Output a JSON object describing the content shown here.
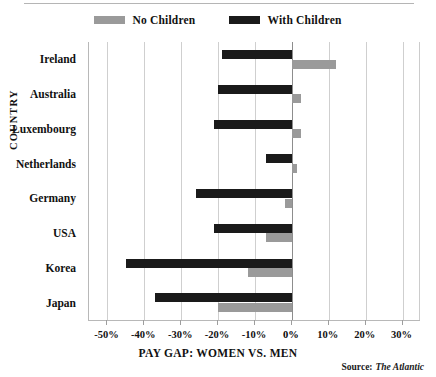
{
  "legend": {
    "entries": [
      {
        "label": "No Children",
        "color": "#9a9a9a",
        "key": "no_children"
      },
      {
        "label": "With Children",
        "color": "#1a1a1a",
        "key": "with_children"
      }
    ]
  },
  "axes": {
    "y_title": "COUNTRY",
    "x_title": "PAY GAP: WOMEN VS. MEN"
  },
  "source": {
    "prefix": "Source:",
    "name": "The Atlantic"
  },
  "chart_data": {
    "type": "bar",
    "orientation": "horizontal",
    "title": "",
    "xlabel": "PAY GAP: WOMEN VS. MEN",
    "ylabel": "COUNTRY",
    "categories": [
      "Ireland",
      "Australia",
      "Luxembourg",
      "Netherlands",
      "Germany",
      "USA",
      "Korea",
      "Japan"
    ],
    "series": [
      {
        "name": "No Children",
        "color": "#9a9a9a",
        "values": [
          12,
          2.5,
          2.5,
          1.5,
          -2,
          -7,
          -12,
          -20
        ]
      },
      {
        "name": "With Children",
        "color": "#1a1a1a",
        "values": [
          -19,
          -20,
          -21,
          -7,
          -26,
          -21,
          -45,
          -37
        ]
      }
    ],
    "xlim": [
      -55,
      35
    ],
    "xticks": [
      -50,
      -40,
      -30,
      -20,
      -10,
      0,
      10,
      20,
      30
    ],
    "xticklabels": [
      "-50%",
      "-40%",
      "-30%",
      "-20%",
      "-10%",
      "0%",
      "10%",
      "20%",
      "30%"
    ],
    "grid": true,
    "grid_axis": "x",
    "legend_position": "top-center",
    "unit": "percent"
  }
}
